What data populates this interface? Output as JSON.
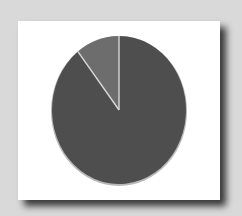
{
  "chart_data": {
    "type": "pie",
    "title": "",
    "legend": [],
    "slices": [
      {
        "label": "",
        "value": 89.5,
        "color": "#4e4e4e"
      },
      {
        "label": "",
        "value": 10.5,
        "color": "#6d6d6d"
      }
    ],
    "start_angle_deg": 0,
    "direction": "clockwise",
    "separator_color": "#d8d8d8",
    "card_color": "#ffffff",
    "background_color": "#d9d9d9"
  }
}
